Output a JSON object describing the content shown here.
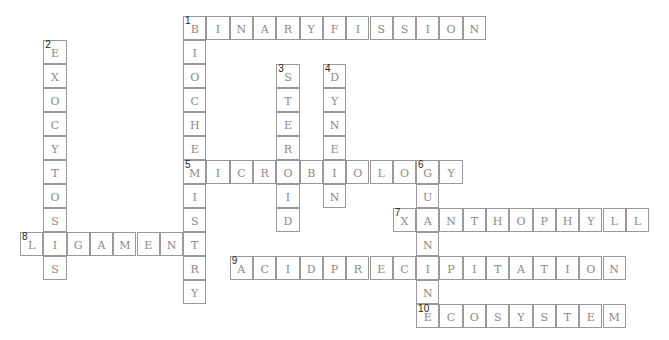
{
  "grid": {
    "origin_x": 20,
    "origin_y": 16,
    "cell_w": 23.3,
    "cell_h": 24
  },
  "words": [
    {
      "number": 1,
      "answer": "BINARYFISSION",
      "row": 0,
      "col": 7,
      "dir": "across"
    },
    {
      "number": 1,
      "answer": "BIOCHEMISTRY",
      "row": 0,
      "col": 7,
      "dir": "down"
    },
    {
      "number": 2,
      "answer": "EXOCYTOSIS",
      "row": 1,
      "col": 1,
      "dir": "down"
    },
    {
      "number": 3,
      "answer": "STEROID",
      "row": 2,
      "col": 11,
      "dir": "down"
    },
    {
      "number": 4,
      "answer": "DYNEIN",
      "row": 2,
      "col": 13,
      "dir": "down"
    },
    {
      "number": 5,
      "answer": "MICROBIOLOGY",
      "row": 6,
      "col": 7,
      "dir": "across"
    },
    {
      "number": 6,
      "answer": "GUANINE",
      "row": 6,
      "col": 17,
      "dir": "down"
    },
    {
      "number": 7,
      "answer": "XANTHOPHYLL",
      "row": 8,
      "col": 16,
      "dir": "across"
    },
    {
      "number": 8,
      "answer": "LIGAMENT",
      "row": 9,
      "col": 0,
      "dir": "across"
    },
    {
      "number": 9,
      "answer": "ACIDPRECIPITATION",
      "row": 10,
      "col": 9,
      "dir": "across"
    },
    {
      "number": 10,
      "answer": "ECOSYSTEM",
      "row": 12,
      "col": 17,
      "dir": "across"
    }
  ],
  "colors": {
    "border": "#9a9a9a",
    "letter": "#8a8a8a",
    "number": "#222222"
  }
}
